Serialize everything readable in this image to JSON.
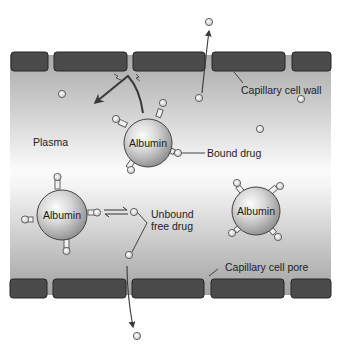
{
  "diagram": {
    "labels": {
      "plasma": "Plasma",
      "capillary_wall": "Capillary cell wall",
      "capillary_pore": "Capillary cell pore",
      "bound_drug": "Bound drug",
      "unbound_line1": "Unbound",
      "unbound_line2": "free drug"
    },
    "proteins": [
      {
        "id": "albumin-1",
        "label": "Albumin",
        "cx": 148,
        "cy": 143,
        "r": 24
      },
      {
        "id": "albumin-2",
        "label": "Albumin",
        "cx": 62,
        "cy": 215,
        "r": 25
      },
      {
        "id": "albumin-3",
        "label": "Albumin",
        "cx": 256,
        "cy": 211,
        "r": 24
      }
    ],
    "colors": {
      "wall_block": "#4a4a4a",
      "wall_block_border": "#2a2a2a",
      "plasma_edge": "#a8a8a8",
      "plasma_center": "#fafafa",
      "sphere_light": "#f2f2f2",
      "sphere_dark": "#8a8a8a",
      "arrow": "#3a3a3a",
      "drug_fill": "#e6e6e6"
    }
  }
}
